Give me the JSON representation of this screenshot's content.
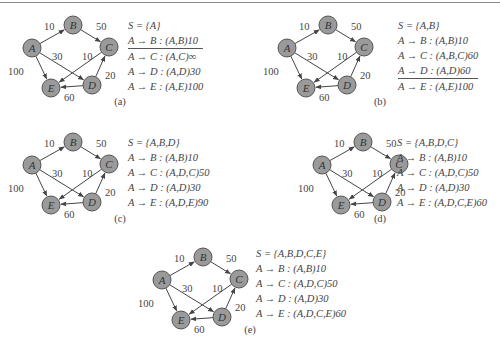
{
  "graph": {
    "nodes": [
      {
        "id": "A",
        "label": "A",
        "x": 32,
        "y": 48
      },
      {
        "id": "B",
        "label": "B",
        "x": 73,
        "y": 25
      },
      {
        "id": "C",
        "label": "C",
        "x": 109,
        "y": 47
      },
      {
        "id": "D",
        "label": "D",
        "x": 92,
        "y": 85
      },
      {
        "id": "E",
        "label": "E",
        "x": 51,
        "y": 88
      }
    ],
    "edges": [
      {
        "from": "A",
        "to": "B",
        "weight": "10",
        "lx": 44,
        "ly": 30
      },
      {
        "from": "B",
        "to": "C",
        "weight": "50",
        "lx": 96,
        "ly": 30
      },
      {
        "from": "A",
        "to": "D",
        "weight": "30",
        "lx": 52,
        "ly": 60
      },
      {
        "from": "A",
        "to": "E",
        "weight": "100",
        "lx": 8,
        "ly": 75
      },
      {
        "from": "C",
        "to": "E",
        "weight": "10",
        "lx": 82,
        "ly": 60
      },
      {
        "from": "D",
        "to": "C",
        "weight": "20",
        "lx": 105,
        "ly": 79
      },
      {
        "from": "D",
        "to": "E",
        "weight": "60",
        "lx": 64,
        "ly": 101
      }
    ],
    "node_fill": "#9a9a9a",
    "node_stroke": "#555555",
    "edge_color": "#444444"
  },
  "panels": [
    {
      "caption": "(a)",
      "set": "S = {A}",
      "rows": [
        "A → B : (A,B)10",
        "A → C : (A,C)∞",
        "A → D : (A,D)30",
        "A → E : (A,E)100"
      ],
      "underline_after": 0
    },
    {
      "caption": "(b)",
      "set": "S = {A,B}",
      "rows": [
        "A → B : (A,B)10",
        "A → C : (A,B,C)60",
        "A → D : (A,D)60",
        "A → E : (A,E)100"
      ],
      "underline_after": 2
    },
    {
      "caption": "(c)",
      "set": "S = {A,B,D}",
      "rows": [
        "A → B : (A,B)10",
        "A → C : (A,D,C)50",
        "A → D : (A,D)30",
        "A → E : (A,D,E)90"
      ],
      "underline_after": -1
    },
    {
      "caption": "(d)",
      "set": "S = {A,B,D,C}",
      "rows": [
        "A → B : (A,B)10",
        "A → C : (A,D,C)50",
        "A → D : (A,D)30",
        "A → E : (A,D,C,E)60"
      ],
      "underline_after": -1
    },
    {
      "caption": "(e)",
      "set": "S = {A,B,D,C,E}",
      "rows": [
        "A → B : (A,B)10",
        "A → C : (A,D,C)50",
        "A → D : (A,D)30",
        "A → E : (A,D,C,E)60"
      ],
      "underline_after": -1
    }
  ]
}
